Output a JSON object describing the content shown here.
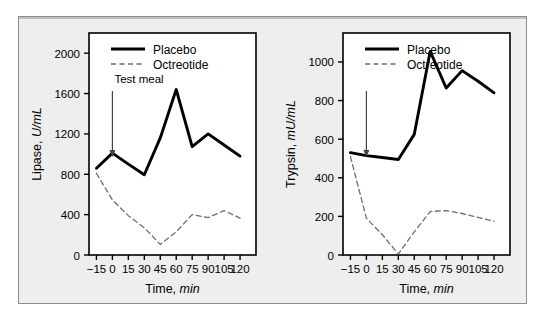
{
  "figure": {
    "background": "#eeeeee",
    "border_color": "#8e8e8e",
    "series_colors": {
      "placebo": "#000000",
      "octreotide": "#6e6e6e"
    }
  },
  "legend": {
    "placebo_label": "Placebo",
    "octreotide_label": "Octreotide",
    "position": "top-left-inside"
  },
  "annotations": {
    "test_meal_label": "Test meal",
    "arrow_icon": "down-arrow-icon",
    "arrow_time_min": 0
  },
  "axes": {
    "x_title_main": "Time, ",
    "x_title_italic": "min",
    "x_ticks": [
      "−15",
      "0",
      "15",
      "30",
      "45",
      "60",
      "75",
      "90",
      "105",
      "120"
    ],
    "x_tick_values": [
      -15,
      0,
      15,
      30,
      45,
      60,
      75,
      90,
      105,
      120
    ],
    "x_min": -22,
    "x_max": 135
  },
  "chart_data": [
    {
      "type": "line",
      "id": "lipase-chart",
      "title": "",
      "xlabel": "Time, min",
      "ylabel": "Lipase, U/mL",
      "ylabel_main": "Lipase, ",
      "ylabel_italic": "U/mL",
      "xlim": [
        -22,
        135
      ],
      "ylim": [
        0,
        2200
      ],
      "grid": false,
      "legend": [
        "Placebo",
        "Octreotide"
      ],
      "legend_position": "top-left",
      "y_ticks": [
        0,
        400,
        800,
        1200,
        1600,
        2000
      ],
      "y_tick_labels": [
        "0",
        "400",
        "800",
        "1200",
        "1600",
        "2000"
      ],
      "x": [
        -15,
        0,
        15,
        30,
        45,
        60,
        75,
        90,
        105,
        120
      ],
      "series": [
        {
          "name": "Placebo",
          "style": "solid",
          "color": "#000000",
          "values": [
            860,
            1010,
            900,
            795,
            1160,
            1640,
            1075,
            1200,
            1090,
            980
          ]
        },
        {
          "name": "Octreotide",
          "style": "dashed",
          "color": "#6e6e6e",
          "values": [
            810,
            545,
            390,
            270,
            105,
            230,
            400,
            370,
            440,
            365
          ]
        }
      ]
    },
    {
      "type": "line",
      "id": "trypsin-chart",
      "title": "",
      "xlabel": "Time, min",
      "ylabel": "Trypsin, mU/mL",
      "ylabel_main": "Trypsin, ",
      "ylabel_italic": "mU/mL",
      "xlim": [
        -22,
        135
      ],
      "ylim": [
        0,
        1150
      ],
      "grid": false,
      "legend": [
        "Placebo",
        "Octreotide"
      ],
      "legend_position": "top-left",
      "y_ticks": [
        0,
        200,
        400,
        600,
        800,
        1000
      ],
      "y_tick_labels": [
        "0",
        "200",
        "400",
        "600",
        "800",
        "1000"
      ],
      "x": [
        -15,
        0,
        15,
        30,
        45,
        60,
        75,
        90,
        105,
        120
      ],
      "series": [
        {
          "name": "Placebo",
          "style": "solid",
          "color": "#000000",
          "values": [
            530,
            515,
            505,
            495,
            625,
            1055,
            865,
            955,
            900,
            840
          ]
        },
        {
          "name": "Octreotide",
          "style": "dashed",
          "color": "#6e6e6e",
          "values": [
            510,
            190,
            105,
            5,
            120,
            225,
            230,
            215,
            195,
            175
          ]
        }
      ]
    }
  ]
}
